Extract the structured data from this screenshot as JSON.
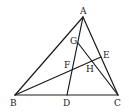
{
  "diagram": {
    "type": "geometry",
    "points": {
      "A": {
        "label": "A",
        "x": 83,
        "y": 17
      },
      "B": {
        "label": "B",
        "x": 15,
        "y": 95
      },
      "C": {
        "label": "C",
        "x": 118,
        "y": 95
      },
      "D": {
        "label": "D",
        "x": 67,
        "y": 95
      },
      "E": {
        "label": "E",
        "x": 101,
        "y": 57
      },
      "F": {
        "label": "F",
        "x": 72,
        "y": 69
      },
      "G": {
        "label": "G",
        "x": 78,
        "y": 43
      },
      "H": {
        "label": "H",
        "x": 92,
        "y": 62
      }
    },
    "segments": [
      "AB",
      "AC",
      "BC",
      "AD",
      "BE",
      "GC"
    ]
  }
}
